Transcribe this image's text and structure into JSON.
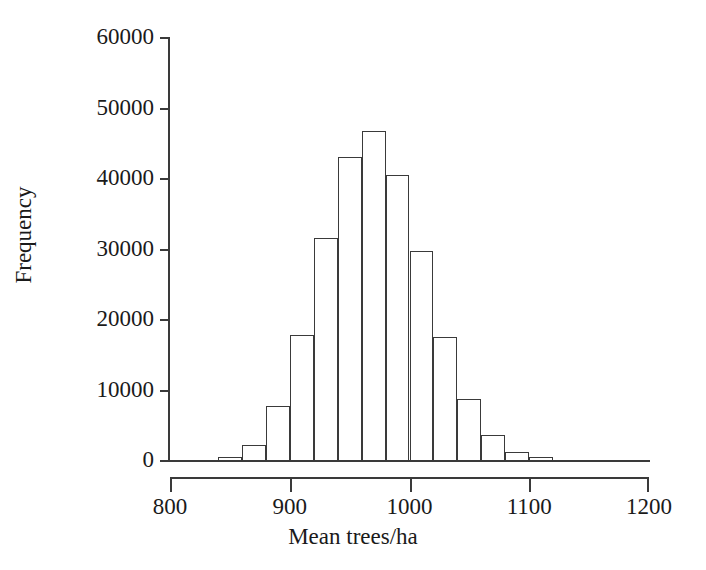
{
  "chart_data": {
    "type": "bar",
    "title": "",
    "subtitle": "",
    "xlabel": "Mean trees/ha",
    "ylabel": "Frequency",
    "xlim": [
      800,
      1200
    ],
    "ylim": [
      0,
      60000
    ],
    "grid": false,
    "legend": null,
    "bin_width": 20,
    "xticks": [
      {
        "value": 800,
        "label": "800"
      },
      {
        "value": 900,
        "label": "900"
      },
      {
        "value": 1000,
        "label": "1000"
      },
      {
        "value": 1100,
        "label": "1100"
      },
      {
        "value": 1200,
        "label": "1200"
      }
    ],
    "yticks": [
      {
        "value": 0,
        "label": "0"
      },
      {
        "value": 10000,
        "label": "10000"
      },
      {
        "value": 20000,
        "label": "20000"
      },
      {
        "value": 30000,
        "label": "30000"
      },
      {
        "value": 40000,
        "label": "40000"
      },
      {
        "value": 50000,
        "label": "50000"
      },
      {
        "value": 60000,
        "label": "60000"
      }
    ],
    "bins": [
      {
        "x0": 840,
        "x1": 860,
        "value": 400
      },
      {
        "x0": 860,
        "x1": 880,
        "value": 2200
      },
      {
        "x0": 880,
        "x1": 900,
        "value": 7700
      },
      {
        "x0": 900,
        "x1": 920,
        "value": 17800
      },
      {
        "x0": 920,
        "x1": 940,
        "value": 31500
      },
      {
        "x0": 940,
        "x1": 960,
        "value": 43000
      },
      {
        "x0": 960,
        "x1": 980,
        "value": 46700
      },
      {
        "x0": 980,
        "x1": 1000,
        "value": 40400
      },
      {
        "x0": 1000,
        "x1": 1020,
        "value": 29600
      },
      {
        "x0": 1020,
        "x1": 1040,
        "value": 17400
      },
      {
        "x0": 1040,
        "x1": 1060,
        "value": 8600
      },
      {
        "x0": 1060,
        "x1": 1080,
        "value": 3500
      },
      {
        "x0": 1080,
        "x1": 1100,
        "value": 1100
      },
      {
        "x0": 1100,
        "x1": 1120,
        "value": 400
      }
    ],
    "categories": [
      "840-860",
      "860-880",
      "880-900",
      "900-920",
      "920-940",
      "940-960",
      "960-980",
      "980-1000",
      "1000-1020",
      "1020-1040",
      "1040-1060",
      "1060-1080",
      "1080-1100",
      "1100-1120"
    ],
    "values": [
      400,
      2200,
      7700,
      17800,
      31500,
      43000,
      46700,
      40400,
      29600,
      17400,
      8600,
      3500,
      1100,
      400
    ],
    "colors": {
      "bar_fill": "#ffffff",
      "bar_stroke": "#3a3a3a",
      "axis": "#3a3a3a",
      "text": "#1a1a1a",
      "background": "#ffffff"
    }
  }
}
